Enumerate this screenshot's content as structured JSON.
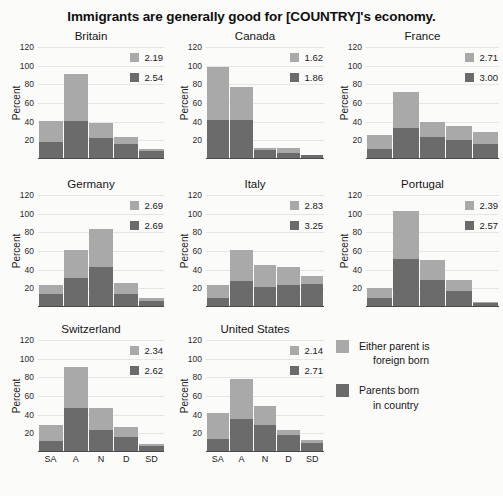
{
  "chart_data": {
    "type": "bar",
    "subtype": "stacked-bar-small-multiples",
    "title": "Immigrants are generally good for [COUNTRY]'s economy.",
    "xlabel": "",
    "ylabel": "Percent",
    "ylim": [
      0,
      120
    ],
    "yticks": [
      20,
      40,
      60,
      80,
      100,
      120
    ],
    "categories": [
      "SA",
      "A",
      "N",
      "D",
      "SD"
    ],
    "grid": true,
    "legend_position": "bottom-right",
    "series": [
      {
        "name": "Either parent is foreign born",
        "color": "#a9a9a9"
      },
      {
        "name": "Parents born in country",
        "color": "#6b6b6b"
      }
    ],
    "panels": [
      {
        "name": "Britain",
        "annotations": {
          "light_value": "2.19",
          "dark_value": "2.54"
        },
        "values_dark": [
          17,
          40,
          21,
          15,
          7
        ],
        "values_light": [
          23,
          50,
          16,
          7,
          3
        ],
        "totals": [
          40,
          90,
          37,
          22,
          10
        ]
      },
      {
        "name": "Canada",
        "annotations": {
          "light_value": "1.62",
          "dark_value": "1.86"
        },
        "values_dark": [
          41,
          41,
          9,
          5,
          3
        ],
        "values_light": [
          57,
          35,
          2,
          6,
          0
        ],
        "totals": [
          98,
          76,
          11,
          11,
          3
        ]
      },
      {
        "name": "France",
        "annotations": {
          "light_value": "2.71",
          "dark_value": "3.00"
        },
        "values_dark": [
          10,
          32,
          23,
          19,
          15
        ],
        "values_light": [
          15,
          39,
          16,
          15,
          13
        ],
        "totals": [
          25,
          71,
          39,
          34,
          28
        ]
      },
      {
        "name": "Germany",
        "annotations": {
          "light_value": "2.69",
          "dark_value": "2.69"
        },
        "values_dark": [
          13,
          30,
          42,
          13,
          5
        ],
        "values_light": [
          10,
          30,
          40,
          12,
          4
        ],
        "totals": [
          23,
          60,
          82,
          25,
          9
        ]
      },
      {
        "name": "Italy",
        "annotations": {
          "light_value": "2.83",
          "dark_value": "3.25"
        },
        "values_dark": [
          9,
          27,
          20,
          22,
          24
        ],
        "values_light": [
          13,
          33,
          24,
          20,
          8
        ],
        "totals": [
          22,
          60,
          44,
          42,
          32
        ]
      },
      {
        "name": "Portugal",
        "annotations": {
          "light_value": "2.39",
          "dark_value": "2.57"
        },
        "values_dark": [
          9,
          50,
          28,
          16,
          3
        ],
        "values_light": [
          10,
          52,
          21,
          12,
          1
        ],
        "totals": [
          19,
          102,
          49,
          28,
          4
        ]
      },
      {
        "name": "Switzerland",
        "annotations": {
          "light_value": "2.34",
          "dark_value": "2.62"
        },
        "values_dark": [
          11,
          46,
          23,
          15,
          5
        ],
        "values_light": [
          17,
          44,
          23,
          11,
          2
        ],
        "totals": [
          28,
          90,
          46,
          26,
          7
        ]
      },
      {
        "name": "United States",
        "annotations": {
          "light_value": "2.14",
          "dark_value": "2.71"
        },
        "values_dark": [
          13,
          34,
          28,
          17,
          9
        ],
        "values_light": [
          28,
          43,
          20,
          6,
          3
        ],
        "totals": [
          41,
          77,
          48,
          23,
          12
        ]
      }
    ]
  },
  "legend": {
    "light": {
      "line1": "Either parent is",
      "line2": "foreign born",
      "color": "#a9a9a9"
    },
    "dark": {
      "line1": "Parents born",
      "line2": "in country",
      "color": "#6b6b6b"
    }
  }
}
